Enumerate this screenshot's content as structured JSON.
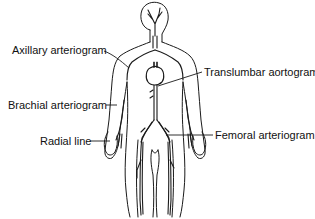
{
  "diagram": {
    "colors": {
      "line": "#1a1a1a",
      "background": "#ffffff",
      "text": "#111111"
    },
    "labels": [
      {
        "id": "axillary",
        "text": "Axillary arteriogram",
        "side": "left"
      },
      {
        "id": "brachial",
        "text": "Brachial arteriogram",
        "side": "left"
      },
      {
        "id": "radial",
        "text": "Radial line",
        "side": "left"
      },
      {
        "id": "translumbar",
        "text": "Translumbar aortogram",
        "side": "right"
      },
      {
        "id": "femoral",
        "text": "Femoral arteriogram",
        "side": "right"
      }
    ]
  }
}
